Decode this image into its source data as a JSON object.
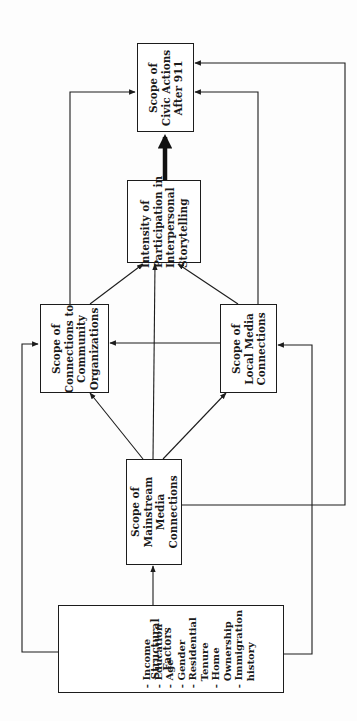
{
  "diagram": {
    "orientation": "rotated-90-ccw",
    "colors": {
      "line": "#1c1c1c",
      "box_border": "#1c1c1c",
      "text": "#1a1a1a",
      "background": "#ffffff"
    },
    "nodes": {
      "civic": {
        "lines": [
          "Scope of",
          "Civic Actions",
          "After 911"
        ]
      },
      "storytelling": {
        "lines": [
          "Intensity of",
          "Participation in",
          "Interpersonal",
          "Storytelling"
        ]
      },
      "community": {
        "lines": [
          "Scope of",
          "Connections to",
          "Community",
          "Organizations"
        ]
      },
      "local": {
        "lines": [
          "Scope of",
          "Local Media",
          "Connections"
        ]
      },
      "mainstream": {
        "lines": [
          "Scope of",
          "Mainstream",
          "Media",
          "Connections"
        ]
      },
      "structural": {
        "title": [
          "Structural",
          "Factors"
        ],
        "items": [
          "- Income",
          "- Education",
          "- Age",
          "- Gender",
          "- Residential",
          "  Tenure",
          "- Home",
          "  Ownership",
          "- Immigration",
          "  history"
        ]
      }
    },
    "edges": [
      {
        "from": "structural",
        "to": "mainstream"
      },
      {
        "from": "structural",
        "to": "community"
      },
      {
        "from": "structural",
        "to": "local"
      },
      {
        "from": "mainstream",
        "to": "community"
      },
      {
        "from": "mainstream",
        "to": "local"
      },
      {
        "from": "mainstream",
        "to": "storytelling"
      },
      {
        "from": "mainstream",
        "to": "civic"
      },
      {
        "from": "local",
        "to": "community"
      },
      {
        "from": "community",
        "to": "storytelling"
      },
      {
        "from": "local",
        "to": "storytelling"
      },
      {
        "from": "community",
        "to": "civic"
      },
      {
        "from": "local",
        "to": "civic"
      },
      {
        "from": "storytelling",
        "to": "civic",
        "emphasis": "thick"
      }
    ]
  }
}
